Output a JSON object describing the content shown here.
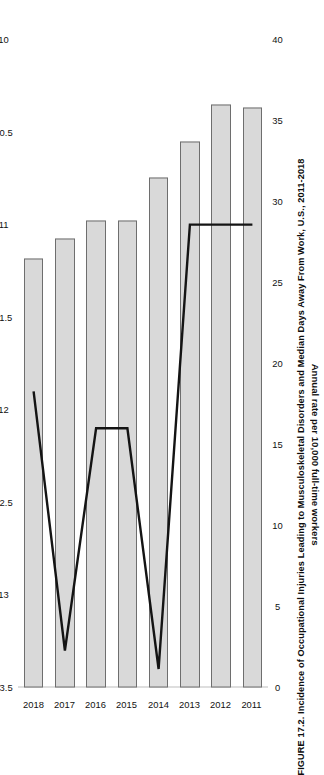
{
  "figure": {
    "title": "FIGURE 17.2. Incidence of Occupational Injuries Leading to Musculoskeletal Disorders and Median Days Away From Work, U.S., 2011-2018"
  },
  "axes": {
    "rate_axis_title": "Annual rate per 10,000 full-time workers",
    "rate_ticks": [
      "40",
      "35",
      "30",
      "25",
      "20",
      "15",
      "10",
      "5",
      "0"
    ],
    "days_axis_title": "",
    "days_ticks": [
      "13.5",
      "13",
      "12.5",
      "12",
      "11.5",
      "11",
      "10.5",
      "10"
    ],
    "category_ticks": [
      "2018",
      "2017",
      "2016",
      "2015",
      "2014",
      "2013",
      "2012",
      "2011"
    ]
  },
  "chart_data": {
    "type": "bar",
    "title": "FIGURE 17.2. Incidence of Occupational Injuries Leading to Musculoskeletal Disorders and Median Days Away From Work, U.S., 2011-2018",
    "xlabel": "",
    "ylabel": "Annual rate per 10,000 full-time workers",
    "categories": [
      "2011",
      "2012",
      "2013",
      "2014",
      "2015",
      "2016",
      "2017",
      "2018"
    ],
    "ylim": [
      0,
      40
    ],
    "y2lim": [
      10,
      13.5
    ],
    "y2_inverted": true,
    "grid": false,
    "legend": "none",
    "orientation": "horizontal-bars",
    "series": [
      {
        "name": "Annual rate per 10,000 full-time workers",
        "type": "bar",
        "axis": "primary",
        "values": [
          35.8,
          36.0,
          33.7,
          31.5,
          28.8,
          28.8,
          27.7,
          26.5
        ]
      },
      {
        "name": "Median days away from work",
        "type": "line",
        "axis": "secondary",
        "values": [
          11.0,
          11.0,
          11.0,
          13.4,
          12.1,
          12.1,
          13.3,
          11.9
        ]
      }
    ]
  },
  "style": {
    "bar_fill": "#d9d9d9",
    "bar_stroke": "#6e6e6e",
    "line_color": "#141414",
    "axis_color": "#bdbdbd",
    "background": "#ffffff"
  }
}
